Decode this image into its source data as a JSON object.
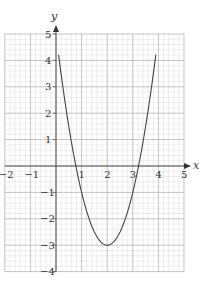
{
  "chart_data": {
    "type": "line",
    "title": "",
    "xlabel": "x",
    "ylabel": "y",
    "xlim": [
      -2,
      5
    ],
    "ylim": [
      -4,
      5
    ],
    "grid": true,
    "minor_grid_step": 0.2,
    "major_grid_step": 1,
    "x_ticks": [
      "-2",
      "-1",
      "1",
      "2",
      "3",
      "4",
      "5"
    ],
    "y_ticks": [
      "5",
      "4",
      "3",
      "2",
      "1",
      "-1",
      "-2",
      "-3",
      "-4"
    ],
    "series": [
      {
        "name": "y = 2(x - 2)^2 - 3",
        "x": [
          0.1,
          0.5,
          0.775,
          1.0,
          1.5,
          2.0,
          2.5,
          3.0,
          3.225,
          3.5,
          3.9
        ],
        "y": [
          4.22,
          1.5,
          0.0,
          -1.0,
          -2.5,
          -3.0,
          -2.5,
          -1.0,
          0.0,
          1.5,
          4.22
        ]
      }
    ],
    "key_points": {
      "vertex": [
        2,
        -3
      ],
      "roots": [
        0.78,
        3.22
      ]
    },
    "colors": {
      "curve": "#444444",
      "axes": "#555555",
      "major_grid": "#aaaaaa",
      "minor_grid": "#dddddd"
    }
  }
}
